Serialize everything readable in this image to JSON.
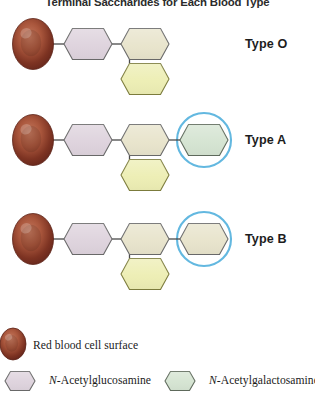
{
  "figure": {
    "title": "Terminal Saccharides for Each Blood Type",
    "width": 315,
    "height": 396
  },
  "colors": {
    "rbc_dark": "#6d2a1c",
    "rbc_mid": "#9e4b33",
    "rbc_light": "#c2735a",
    "rbc_edge": "#5d2318",
    "glcnac": "#ded3dd",
    "glcnac_edge": "#6a6a6a",
    "galactose": "#e8e4cc",
    "galactose_edge": "#6a6a6a",
    "fucose": "#edeeb4",
    "fucose_edge": "#7d7d3d",
    "galnac": "#d5e4d2",
    "galnac_edge": "#5f6b5c",
    "link": "#4a4a4a",
    "highlight_ring": "#63b8e0"
  },
  "rows": [
    {
      "id": "type-o",
      "label": "Type O",
      "label_x": 245,
      "label_y": 37,
      "cy": 44,
      "highlight": false,
      "chain": [
        {
          "name": "n-acetylglucosamine-hexagon",
          "fill_key": "glcnac",
          "edge_key": "glcnac_edge",
          "cx": 88
        },
        {
          "name": "galactose-hexagon",
          "fill_key": "galactose",
          "edge_key": "galactose_edge",
          "cx": 145
        }
      ],
      "branch": {
        "name": "fucose-hexagon",
        "fill_key": "fucose",
        "edge_key": "fucose_edge",
        "cx": 145,
        "cy": 79
      }
    },
    {
      "id": "type-a",
      "label": "Type A",
      "label_x": 245,
      "label_y": 133,
      "cy": 140,
      "highlight": true,
      "highlight_cx": 204,
      "highlight_r": 27,
      "chain": [
        {
          "name": "n-acetylglucosamine-hexagon",
          "fill_key": "glcnac",
          "edge_key": "glcnac_edge",
          "cx": 88
        },
        {
          "name": "galactose-hexagon",
          "fill_key": "galactose",
          "edge_key": "galactose_edge",
          "cx": 145
        },
        {
          "name": "n-acetylgalactosamine-hexagon",
          "fill_key": "galnac",
          "edge_key": "galnac_edge",
          "cx": 204
        }
      ],
      "branch": {
        "name": "fucose-hexagon",
        "fill_key": "fucose",
        "edge_key": "fucose_edge",
        "cx": 145,
        "cy": 175
      }
    },
    {
      "id": "type-b",
      "label": "Type B",
      "label_x": 245,
      "label_y": 232,
      "cy": 239,
      "highlight": true,
      "highlight_cx": 204,
      "highlight_r": 27,
      "chain": [
        {
          "name": "n-acetylglucosamine-hexagon",
          "fill_key": "glcnac",
          "edge_key": "glcnac_edge",
          "cx": 88
        },
        {
          "name": "galactose-hexagon",
          "fill_key": "galactose",
          "edge_key": "galactose_edge",
          "cx": 145
        },
        {
          "name": "galactose-terminal-hexagon",
          "fill_key": "galactose",
          "edge_key": "galactose_edge",
          "cx": 204
        }
      ],
      "branch": {
        "name": "fucose-hexagon",
        "fill_key": "fucose",
        "edge_key": "fucose_edge",
        "cx": 145,
        "cy": 274
      }
    }
  ],
  "legend": {
    "items": [
      {
        "id": "legend-rbc",
        "swatch": "red-blood-cell",
        "text_prefix": "",
        "text": "Red blood cell surface",
        "swatch_cx": 13,
        "swatch_cy": 344,
        "text_x": 33,
        "text_y": 339
      },
      {
        "id": "legend-glcnac",
        "swatch": "hexagon",
        "fill_key": "glcnac",
        "edge_key": "glcnac_edge",
        "text_prefix": "N",
        "text": "-Acetylglucosamine",
        "swatch_cx": 20,
        "swatch_cy": 381,
        "text_x": 49,
        "text_y": 374
      },
      {
        "id": "legend-galnac",
        "swatch": "hexagon",
        "fill_key": "galnac",
        "edge_key": "galnac_edge",
        "text_prefix": "N",
        "text": "-Acetylgalactosamine",
        "swatch_cx": 180,
        "swatch_cy": 381,
        "text_x": 209,
        "text_y": 374
      }
    ]
  }
}
